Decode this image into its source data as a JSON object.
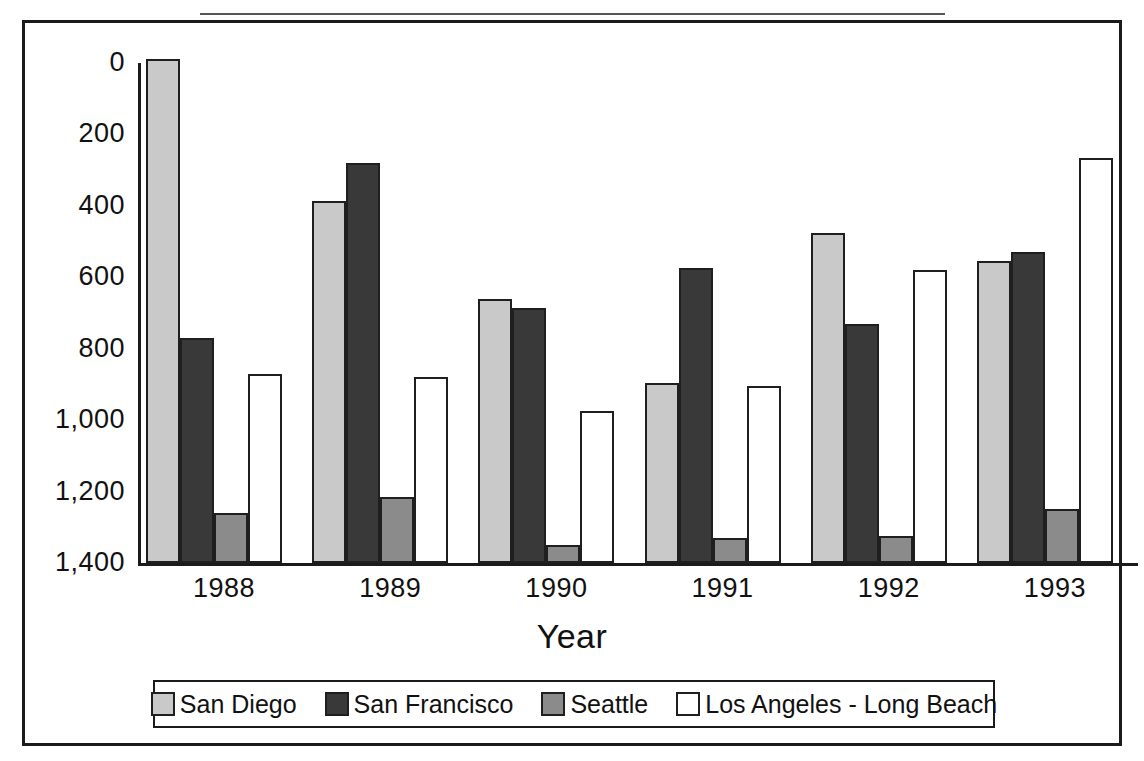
{
  "figure": {
    "x_axis_title": "Year",
    "legend_items": [
      {
        "label": "San Diego",
        "color": "#c9c9c9"
      },
      {
        "label": "San Francisco",
        "color": "#393939"
      },
      {
        "label": "Seattle",
        "color": "#8b8b8b"
      },
      {
        "label": "Los Angeles - Long Beach",
        "color": "#ffffff"
      }
    ],
    "y_ticks": [
      "1,400",
      "1,200",
      "1,000",
      "800",
      "600",
      "400",
      "200",
      "0"
    ],
    "x_ticks": [
      "1988",
      "1989",
      "1990",
      "1991",
      "1992",
      "1993"
    ]
  },
  "chart_data": {
    "type": "bar",
    "title": "",
    "xlabel": "Year",
    "ylabel": "",
    "ylim": [
      0,
      1400
    ],
    "ytick_values": [
      0,
      200,
      400,
      600,
      800,
      1000,
      1200,
      1400
    ],
    "grid": false,
    "legend_position": "bottom",
    "categories": [
      "1988",
      "1989",
      "1990",
      "1991",
      "1992",
      "1993"
    ],
    "series": [
      {
        "name": "San Diego",
        "color": "#c9c9c9",
        "values": [
          1410,
          1015,
          740,
          505,
          925,
          845
        ]
      },
      {
        "name": "San Francisco",
        "color": "#393939",
        "values": [
          630,
          1120,
          715,
          825,
          670,
          870
        ]
      },
      {
        "name": "Seattle",
        "color": "#8b8b8b",
        "values": [
          140,
          185,
          50,
          70,
          75,
          150
        ]
      },
      {
        "name": "Los Angeles - Long Beach",
        "color": "#ffffff",
        "values": [
          530,
          520,
          425,
          495,
          820,
          1135
        ]
      }
    ]
  }
}
